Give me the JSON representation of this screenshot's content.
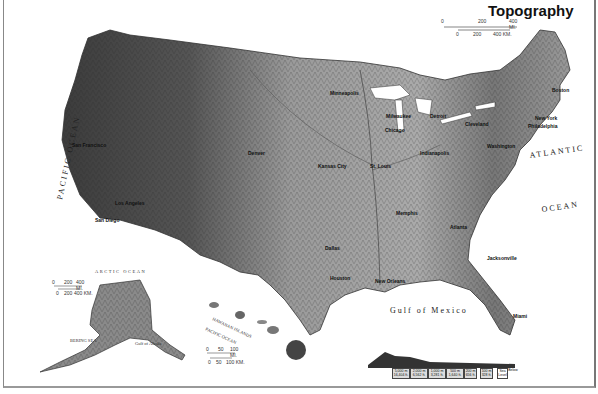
{
  "map": {
    "title": "Topography",
    "scale_main": {
      "miles": [
        "0",
        "200",
        "400 MI."
      ],
      "km": [
        "0",
        "200",
        "400 KM."
      ]
    },
    "scale_alaska": {
      "miles": [
        "0",
        "200",
        "400 MI."
      ],
      "km": [
        "0",
        "200",
        "400 KM."
      ]
    },
    "scale_hawaii": {
      "miles": [
        "0",
        "50",
        "100 MI."
      ],
      "km": [
        "0",
        "50",
        "100 KM."
      ]
    },
    "oceans": {
      "pacific": "PACIFIC OCEAN",
      "atlantic": "ATLANTIC",
      "atlantic2": "OCEAN",
      "gulf": "Gulf of Mexico",
      "arctic": "ARCTIC OCEAN",
      "bering": "BERING SEA",
      "gulf_alaska": "Gulf of Alaska",
      "hawaii_pacific": "PACIFIC OCEAN",
      "hawaiian_islands": "HAWAIIAN ISLANDS"
    },
    "cities": [
      {
        "name": "San Francisco",
        "x": 72,
        "y": 147
      },
      {
        "name": "Los Angeles",
        "x": 115,
        "y": 205
      },
      {
        "name": "San Diego",
        "x": 95,
        "y": 222
      },
      {
        "name": "Denver",
        "x": 248,
        "y": 155
      },
      {
        "name": "Kansas City",
        "x": 318,
        "y": 168
      },
      {
        "name": "Minneapolis",
        "x": 330,
        "y": 95
      },
      {
        "name": "Milwaukee",
        "x": 388,
        "y": 118
      },
      {
        "name": "Chicago",
        "x": 385,
        "y": 132
      },
      {
        "name": "Detroit",
        "x": 430,
        "y": 118
      },
      {
        "name": "Cleveland",
        "x": 465,
        "y": 122
      },
      {
        "name": "St. Louis",
        "x": 370,
        "y": 168
      },
      {
        "name": "Indianapolis",
        "x": 420,
        "y": 155
      },
      {
        "name": "Washington",
        "x": 487,
        "y": 148
      },
      {
        "name": "Philadelphia",
        "x": 530,
        "y": 128
      },
      {
        "name": "New York",
        "x": 540,
        "y": 118
      },
      {
        "name": "Boston",
        "x": 555,
        "y": 90
      },
      {
        "name": "Memphis",
        "x": 396,
        "y": 215
      },
      {
        "name": "Atlanta",
        "x": 450,
        "y": 229
      },
      {
        "name": "Dallas",
        "x": 325,
        "y": 250
      },
      {
        "name": "Houston",
        "x": 330,
        "y": 280
      },
      {
        "name": "New Orleans",
        "x": 375,
        "y": 283
      },
      {
        "name": "Jacksonville",
        "x": 487,
        "y": 260
      },
      {
        "name": "Miami",
        "x": 515,
        "y": 318
      }
    ],
    "features": [
      "Long Island",
      "Chesapeake Bay",
      "C. Hatteras",
      "C. Fear",
      "C. Canaveral",
      "Okeechobee",
      "Mississippi Delta",
      "Lake Michigan",
      "Kodiak I.",
      "Alexander Archipelago",
      "St. Lawrence",
      "Kauai",
      "Oahu",
      "Molokai",
      "Maui",
      "Honolulu",
      "Hawaii"
    ],
    "relief_legend": {
      "boxes": [
        "5,000 m 16,404 ft.",
        "2,000 m 6,562 ft.",
        "1,000 m 3,281 ft.",
        "500 m 1,640 ft.",
        "200 m 656 ft.",
        "100 m 328 ft.",
        "Sea Level",
        "Below"
      ]
    },
    "colors": {
      "land_dark": "#3a3a3a",
      "land_mid": "#8a8a8a",
      "land_light": "#c8c8c8",
      "water": "#ffffff"
    }
  }
}
